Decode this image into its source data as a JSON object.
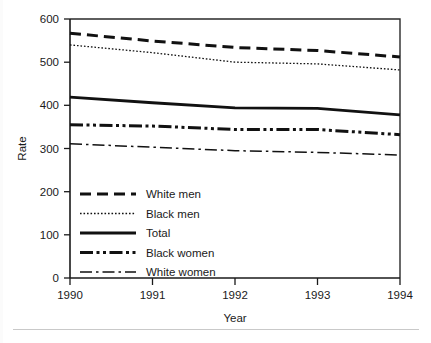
{
  "figure": {
    "background": "#ffffff",
    "ink_color": "#111111"
  },
  "chart_data": {
    "type": "line",
    "title": "",
    "xlabel": "Year",
    "ylabel": "Rate",
    "x": [
      1990,
      1991,
      1992,
      1993,
      1994
    ],
    "xticklabels": [
      "1990",
      "1991",
      "1992",
      "1993",
      "1994"
    ],
    "xlim": [
      1990,
      1994
    ],
    "ylim": [
      0,
      600
    ],
    "yticks": [
      0,
      100,
      200,
      300,
      400,
      500,
      600
    ],
    "yticklabels": [
      "0",
      "100",
      "200",
      "300",
      "400",
      "500",
      "600"
    ],
    "grid": false,
    "legend_position": "lower-left-inside",
    "series": [
      {
        "name": "White men",
        "style": "dashed-thick",
        "values": [
          567,
          549,
          534,
          527,
          512
        ]
      },
      {
        "name": "Black men",
        "style": "dotted-thin",
        "values": [
          540,
          522,
          500,
          496,
          482
        ]
      },
      {
        "name": "Total",
        "style": "solid-thick",
        "values": [
          419,
          406,
          394,
          393,
          378
        ]
      },
      {
        "name": "Black women",
        "style": "dash-dot-dot-thick",
        "values": [
          355,
          352,
          344,
          344,
          332
        ]
      },
      {
        "name": "White women",
        "style": "dash-dot-thin",
        "values": [
          311,
          303,
          295,
          291,
          285
        ]
      }
    ]
  },
  "legend": {
    "entries": [
      {
        "label": "White men"
      },
      {
        "label": "Black men"
      },
      {
        "label": "Total"
      },
      {
        "label": "Black women"
      },
      {
        "label": "White women"
      }
    ]
  },
  "caption": {
    "rule_visible": true,
    "text": ""
  }
}
